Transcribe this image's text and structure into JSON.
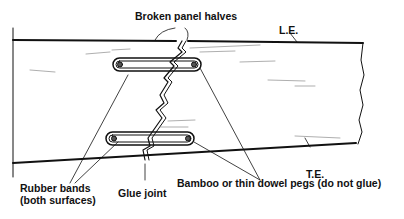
{
  "diagram": {
    "labels": {
      "broken_panel_halves": "Broken panel halves",
      "le": "L.E.",
      "te": "T.E.",
      "rubber_bands_line1": "Rubber bands",
      "rubber_bands_line2": "(both surfaces)",
      "glue_joint": "Glue joint",
      "pegs": "Bamboo or thin dowel pegs (do not glue)"
    },
    "colors": {
      "ink": "#111111",
      "background": "#ffffff"
    }
  }
}
